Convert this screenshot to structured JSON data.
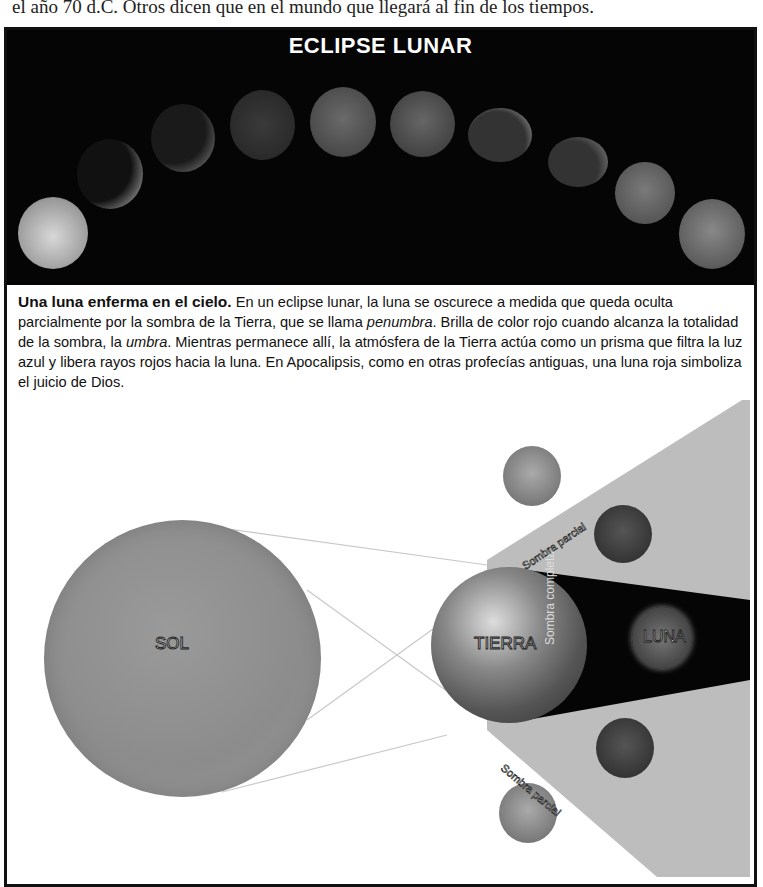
{
  "top_text": "el año 70 d.C. Otros dicen que en el mundo que llegará al fin de los tiempos.",
  "banner": {
    "title": "ECLIPSE LUNAR",
    "moon_phases_count": 11
  },
  "caption": {
    "lead": "Una luna enferma en el cielo.",
    "body_1": " En un eclipse lunar, la luna se oscurece a medida que queda oculta parcialmente por la sombra de la Tierra, que se llama ",
    "term_1": "penumbra",
    "body_2": ". Brilla de color rojo cuando alcanza la totalidad de la sombra, la ",
    "term_2": "umbra",
    "body_3": ". Mientras permanece allí, la atmósfera de la Tierra actúa como un prisma que filtra la luz azul y libera rayos rojos hacia la luna. En Apocalipsis, como en otras profecías antiguas, una luna roja simboliza el juicio de Dios."
  },
  "diagram": {
    "sun_label": "SOL",
    "earth_label": "TIERRA",
    "moon_label": "LUNA",
    "umbra_label": "Sombra completa",
    "penumbra_top_label": "Sombra parcial",
    "penumbra_bottom_label": "Sombra parcial"
  }
}
